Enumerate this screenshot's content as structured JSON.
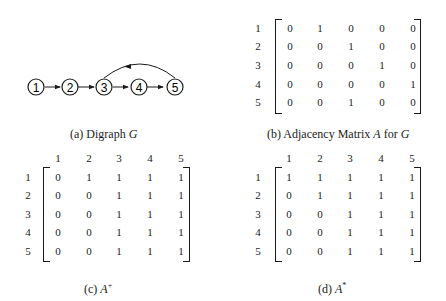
{
  "figure": {
    "a": {
      "caption_prefix": "(a)  Digraph",
      "caption_var": "G",
      "nodes": [
        "1",
        "2",
        "3",
        "4",
        "5"
      ],
      "edges": [
        [
          "1",
          "2"
        ],
        [
          "2",
          "3"
        ],
        [
          "3",
          "4"
        ],
        [
          "4",
          "5"
        ],
        [
          "5",
          "3"
        ]
      ]
    },
    "b": {
      "caption_prefix": "(b)  Adjacency Matrix",
      "caption_var": "A",
      "caption_mid": "for",
      "caption_var2": "G",
      "row_labels": [
        "1",
        "2",
        "3",
        "4",
        "5"
      ],
      "rows": [
        [
          "0",
          "1",
          "0",
          "0",
          "0"
        ],
        [
          "0",
          "0",
          "1",
          "0",
          "0"
        ],
        [
          "0",
          "0",
          "0",
          "1",
          "0"
        ],
        [
          "0",
          "0",
          "0",
          "0",
          "1"
        ],
        [
          "0",
          "0",
          "1",
          "0",
          "0"
        ]
      ]
    },
    "c": {
      "caption_prefix": "(c)",
      "caption_var": "A",
      "caption_sup": "+",
      "col_labels": [
        "1",
        "2",
        "3",
        "4",
        "5"
      ],
      "row_labels": [
        "1",
        "2",
        "3",
        "4",
        "5"
      ],
      "rows": [
        [
          "0",
          "1",
          "1",
          "1",
          "1"
        ],
        [
          "0",
          "0",
          "1",
          "1",
          "1"
        ],
        [
          "0",
          "0",
          "1",
          "1",
          "1"
        ],
        [
          "0",
          "0",
          "1",
          "1",
          "1"
        ],
        [
          "0",
          "0",
          "1",
          "1",
          "1"
        ]
      ]
    },
    "d": {
      "caption_prefix": "(d)",
      "caption_var": "A",
      "caption_sup": "*",
      "col_labels": [
        "1",
        "2",
        "3",
        "4",
        "5"
      ],
      "row_labels": [
        "1",
        "2",
        "3",
        "4",
        "5"
      ],
      "rows": [
        [
          "1",
          "1",
          "1",
          "1",
          "1"
        ],
        [
          "0",
          "1",
          "1",
          "1",
          "1"
        ],
        [
          "0",
          "0",
          "1",
          "1",
          "1"
        ],
        [
          "0",
          "0",
          "1",
          "1",
          "1"
        ],
        [
          "0",
          "0",
          "1",
          "1",
          "1"
        ]
      ]
    }
  }
}
